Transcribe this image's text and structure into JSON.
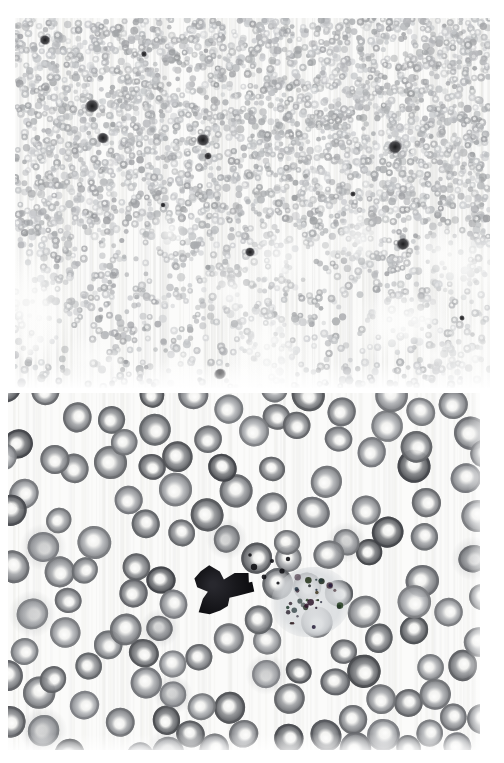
{
  "figure": {
    "title_faint": "",
    "background_color": "#ffffff",
    "width": 504,
    "height": 763,
    "type": "microscopy-figure",
    "panel_count": 2
  },
  "panels": [
    {
      "id": "panel-top",
      "name": "low-magnification-blood-smear",
      "label": "",
      "x": 15,
      "y": 18,
      "width": 475,
      "height": 370,
      "magnification": "low",
      "stain": "Wright-Giemsa",
      "background_color": "#fbfbfa",
      "field_description": "Dense monolayer of erythrocytes thinning toward the lower portion of the field with scattered darkly stained leukocytes",
      "cells": {
        "erythrocyte_count": 2600,
        "erythrocyte_radius_px": [
          2.2,
          4.2
        ],
        "erythrocyte_color": "#b9bcc0",
        "erythrocyte_pallor_color": "#f2f2f1",
        "leukocyte_color": "#2a2a2c",
        "leukocytes": [
          {
            "x": 30,
            "y": 22,
            "r": 4.5
          },
          {
            "x": 129,
            "y": 36,
            "r": 2.6
          },
          {
            "x": 77,
            "y": 88,
            "r": 6.0
          },
          {
            "x": 88,
            "y": 120,
            "r": 5.0
          },
          {
            "x": 188,
            "y": 122,
            "r": 5.5
          },
          {
            "x": 193,
            "y": 138,
            "r": 3.2
          },
          {
            "x": 380,
            "y": 129,
            "r": 6.0
          },
          {
            "x": 338,
            "y": 176,
            "r": 2.4
          },
          {
            "x": 388,
            "y": 226,
            "r": 5.5
          },
          {
            "x": 235,
            "y": 234,
            "r": 4.2
          },
          {
            "x": 205,
            "y": 356,
            "r": 5.0
          },
          {
            "x": 148,
            "y": 187,
            "r": 2.2
          },
          {
            "x": 447,
            "y": 300,
            "r": 2.4
          }
        ],
        "density_profile": "high at top, progressively sparse and clustered toward bottom"
      }
    },
    {
      "id": "panel-bottom",
      "name": "high-magnification-blood-smear",
      "label": "",
      "x": 8,
      "y": 393,
      "width": 472,
      "height": 357,
      "magnification": "high",
      "stain": "Wright-Giemsa",
      "background_color": "#fbfbfa",
      "field_description": "Erythrocytes with prominent central pallor, normochromic and normocytic, with a single large darkly stained leukocyte and adjacent granular debris near the field center",
      "cells": {
        "erythrocyte_count": 135,
        "erythrocyte_radius_px": [
          13,
          17
        ],
        "erythrocyte_color": "#808285",
        "erythrocyte_rim_color": "#6a6c6f",
        "erythrocyte_pallor_color": "#f5f5f4",
        "leukocyte": {
          "x": 212,
          "y": 196,
          "rx": 30,
          "ry": 25,
          "color": "#17171a",
          "description": "dense dark-staining nucleus"
        },
        "debris_patch": {
          "x": 268,
          "y": 178,
          "width": 70,
          "height": 62,
          "color": "#9aa0a6",
          "description": "pale granular cytoplasmic debris with dark granules"
        }
      }
    }
  ],
  "colors": {
    "page_background": "#ffffff",
    "panel_background": "#fbfbfa",
    "erythrocyte": "#808285",
    "leukocyte": "#17171a",
    "pallor": "#f5f5f4"
  }
}
